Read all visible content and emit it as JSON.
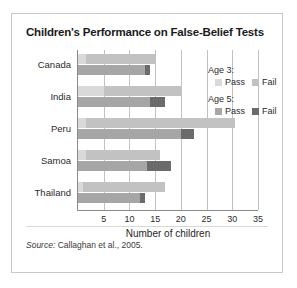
{
  "title": "Children's Performance on False-Belief Tests",
  "source": {
    "prefix": "Source:",
    "text": "Callaghan et al., 2005."
  },
  "legend": {
    "groups": [
      {
        "title": "Age 3:",
        "items": [
          {
            "label": "Pass",
            "color": "#d9d9d9"
          },
          {
            "label": "Fail",
            "color": "#c2c2c2"
          }
        ]
      },
      {
        "title": "Age 5:",
        "items": [
          {
            "label": "Pass",
            "color": "#a6a6a6"
          },
          {
            "label": "Fail",
            "color": "#6b6b6b"
          }
        ]
      }
    ]
  },
  "chart_data": {
    "type": "bar",
    "orientation": "horizontal",
    "stacked": true,
    "grouped": true,
    "title": "Children's Performance on False-Belief Tests",
    "xlabel": "Number of children",
    "ylabel": "",
    "xlim": [
      0,
      35
    ],
    "xticks": [
      5,
      10,
      15,
      20,
      25,
      30,
      35
    ],
    "grid": true,
    "legend_position": "inside-right",
    "categories": [
      "Canada",
      "India",
      "Peru",
      "Samoa",
      "Thailand"
    ],
    "series": [
      {
        "name": "Age 3: Pass",
        "group": "Age 3",
        "color": "#d9d9d9",
        "values": [
          1.5,
          5.0,
          1.5,
          1.5,
          1.0
        ]
      },
      {
        "name": "Age 3: Fail",
        "group": "Age 3",
        "color": "#c2c2c2",
        "values": [
          13.5,
          15.0,
          29.0,
          14.5,
          16.0
        ]
      },
      {
        "name": "Age 5: Pass",
        "group": "Age 5",
        "color": "#a6a6a6",
        "values": [
          13.0,
          14.0,
          20.0,
          13.5,
          12.0
        ]
      },
      {
        "name": "Age 5: Fail",
        "group": "Age 5",
        "color": "#6b6b6b",
        "values": [
          1.0,
          3.0,
          2.5,
          4.5,
          1.0
        ]
      }
    ],
    "totals": {
      "age3": [
        15,
        20,
        30.5,
        16,
        17
      ],
      "age5": [
        14,
        17,
        22.5,
        18,
        13
      ]
    }
  },
  "colors": {
    "age3_pass": "#d9d9d9",
    "age3_fail": "#c2c2c2",
    "age5_pass": "#a6a6a6",
    "age5_fail": "#6b6b6b",
    "grid": "#c2c2c2",
    "axis": "#8a8a8a",
    "frame": "#c9c9c9",
    "background": "#ffffff",
    "text": "#2b2b2b"
  }
}
